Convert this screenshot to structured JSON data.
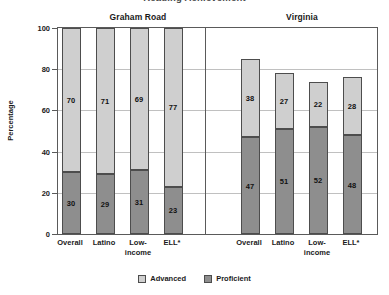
{
  "title": "Reading Achievement",
  "yaxis_title": "Percentage",
  "group_headers": {
    "left": "Graham Road",
    "right": "Virginia"
  },
  "ytick_labels": [
    "100",
    "80",
    "60",
    "40",
    "20",
    "0"
  ],
  "legend": {
    "items": [
      {
        "label": "Advanced",
        "color": "#cfcfcf",
        "name": "advanced"
      },
      {
        "label": "Proficient",
        "color": "#8e8e8e",
        "name": "proficient"
      }
    ]
  },
  "xtick_labels": [
    "Overall",
    "Latino",
    "Low-\nincome",
    "ELL*",
    "Overall",
    "Latino",
    "Low-\nincome",
    "ELL*"
  ],
  "bar_labels": {
    "advanced": [
      "70",
      "71",
      "69",
      "77",
      "38",
      "27",
      "22",
      "28"
    ],
    "proficient": [
      "30",
      "29",
      "31",
      "23",
      "47",
      "51",
      "52",
      "48"
    ]
  },
  "chart_data": {
    "type": "bar",
    "title": "Reading Achievement",
    "xlabel": "",
    "ylabel": "Percentage",
    "ylim": [
      0,
      100
    ],
    "yticks": [
      0,
      20,
      40,
      60,
      80,
      100
    ],
    "grid": true,
    "stacked": true,
    "legend_position": "bottom-center",
    "panels": [
      {
        "name": "Graham Road",
        "categories": [
          "Overall",
          "Latino",
          "Low-income",
          "ELL*"
        ],
        "series": [
          {
            "name": "Proficient",
            "values": [
              30,
              29,
              31,
              23
            ]
          },
          {
            "name": "Advanced",
            "values": [
              70,
              71,
              69,
              77
            ]
          }
        ],
        "totals": [
          100,
          100,
          100,
          100
        ]
      },
      {
        "name": "Virginia",
        "categories": [
          "Overall",
          "Latino",
          "Low-income",
          "ELL*"
        ],
        "series": [
          {
            "name": "Proficient",
            "values": [
              47,
              51,
              52,
              48
            ]
          },
          {
            "name": "Advanced",
            "values": [
              38,
              27,
              22,
              28
            ]
          }
        ],
        "totals": [
          85,
          78,
          74,
          76
        ]
      }
    ]
  }
}
